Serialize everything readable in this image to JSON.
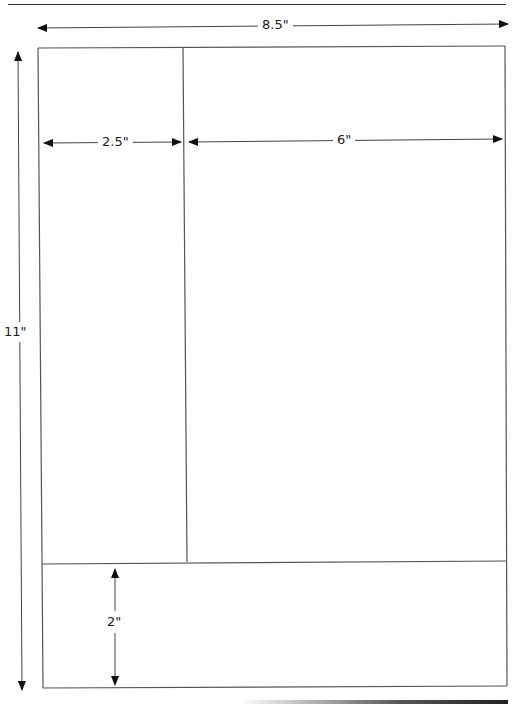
{
  "header": {
    "caption_cut_off": "(figure caption text cut off at top edge)"
  },
  "diagram": {
    "page": {
      "width_label": "8.5\"",
      "height_label": "11\""
    },
    "regions": [
      {
        "name": "left-column",
        "width_label": "2.5\""
      },
      {
        "name": "main-column",
        "width_label": "6\""
      },
      {
        "name": "footer",
        "height_label": "2\""
      }
    ],
    "colors": {
      "line": "#555555",
      "arrow": "#111111",
      "text": "#1a1a1a"
    }
  }
}
